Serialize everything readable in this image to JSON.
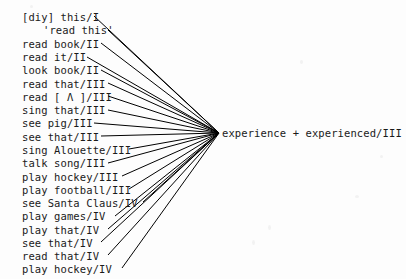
{
  "diagram": {
    "type": "radial-convergence-fan",
    "title": "",
    "background_color": "#fdfdfd",
    "line_color": "#000000",
    "text_color": "#1a1a1a",
    "convergence_point": {
      "x": 219,
      "y": 133
    },
    "target": {
      "label": "experience + experienced/III",
      "x": 222,
      "y": 128
    },
    "sources": [
      {
        "label": "[diy] this/I",
        "x": 22,
        "y": 12,
        "line_start_x": 94,
        "line_start_y": 16
      },
      {
        "label": "'read this'",
        "x": 43,
        "y": 25,
        "line_start_x": 108,
        "line_start_y": 30
      },
      {
        "label": "read book/II",
        "x": 22,
        "y": 39,
        "line_start_x": 101,
        "line_start_y": 43
      },
      {
        "label": "read it/II",
        "x": 22,
        "y": 52,
        "line_start_x": 87,
        "line_start_y": 57
      },
      {
        "label": "look book/II",
        "x": 22,
        "y": 65,
        "line_start_x": 101,
        "line_start_y": 70
      },
      {
        "label": "read that/III",
        "x": 22,
        "y": 79,
        "line_start_x": 108,
        "line_start_y": 83
      },
      {
        "label": "read [ Λ ]/III",
        "x": 22,
        "y": 92,
        "line_start_x": 108,
        "line_start_y": 96
      },
      {
        "label": "sing that/III",
        "x": 22,
        "y": 105,
        "line_start_x": 108,
        "line_start_y": 110
      },
      {
        "label": "see pig/III",
        "x": 22,
        "y": 118,
        "line_start_x": 94,
        "line_start_y": 123
      },
      {
        "label": "see that/III",
        "x": 22,
        "y": 132,
        "line_start_x": 101,
        "line_start_y": 136
      },
      {
        "label": "sing Alouette/III",
        "x": 22,
        "y": 145,
        "line_start_x": 129,
        "line_start_y": 149
      },
      {
        "label": "talk song/III",
        "x": 22,
        "y": 158,
        "line_start_x": 108,
        "line_start_y": 163
      },
      {
        "label": "play hockey/III",
        "x": 22,
        "y": 172,
        "line_start_x": 122,
        "line_start_y": 176
      },
      {
        "label": "play football/III",
        "x": 22,
        "y": 185,
        "line_start_x": 129,
        "line_start_y": 189
      },
      {
        "label": "see Santa Claus/IV",
        "x": 22,
        "y": 198,
        "line_start_x": 143,
        "line_start_y": 202
      },
      {
        "label": "play games/IV",
        "x": 22,
        "y": 211,
        "line_start_x": 115,
        "line_start_y": 216
      },
      {
        "label": "play that/IV",
        "x": 22,
        "y": 225,
        "line_start_x": 108,
        "line_start_y": 229
      },
      {
        "label": "see that/IV",
        "x": 22,
        "y": 238,
        "line_start_x": 101,
        "line_start_y": 242
      },
      {
        "label": "read that/IV",
        "x": 22,
        "y": 251,
        "line_start_x": 108,
        "line_start_y": 255
      },
      {
        "label": "play hockey/IV",
        "x": 22,
        "y": 264,
        "line_start_x": 122,
        "line_start_y": 268
      }
    ]
  }
}
